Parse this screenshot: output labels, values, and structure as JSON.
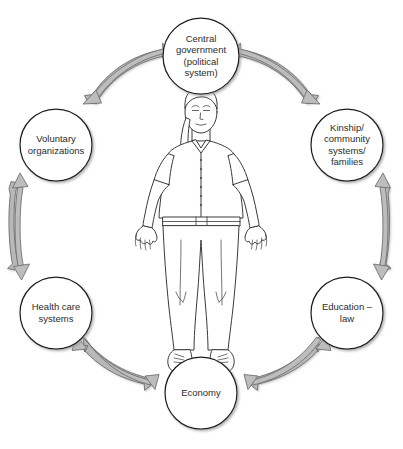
{
  "diagram": {
    "type": "circular-relationship-diagram",
    "background_color": "#ffffff",
    "node_fill": "#ffffff",
    "node_stroke": "#1c1c1c",
    "arrow_fill": "#b3b3b3",
    "arrow_stroke": "#6e6e6e",
    "text_color": "#2b2b2b",
    "center": {
      "name": "person-figure",
      "description": "Line drawing of a standing person with arms outstretched"
    },
    "nodes": [
      {
        "id": "central-government",
        "lines": [
          "Central",
          "government",
          "(political",
          "system)"
        ],
        "cx": 201,
        "cy": 56,
        "r": 38
      },
      {
        "id": "kinship-community-systems-families",
        "lines": [
          "Kinship/",
          "community",
          "systems/",
          "families"
        ],
        "cx": 347,
        "cy": 145,
        "r": 36
      },
      {
        "id": "education-law",
        "lines": [
          "Education –",
          "law"
        ],
        "cx": 347,
        "cy": 313,
        "r": 36
      },
      {
        "id": "economy",
        "lines": [
          "Economy"
        ],
        "cx": 201,
        "cy": 393,
        "r": 36
      },
      {
        "id": "health-care-systems",
        "lines": [
          "Health care",
          "systems"
        ],
        "cx": 56,
        "cy": 313,
        "r": 36
      },
      {
        "id": "voluntary-organizations",
        "lines": [
          "Voluntary",
          "organizations"
        ],
        "cx": 56,
        "cy": 145,
        "r": 36
      }
    ],
    "connections": [
      {
        "from": "voluntary-organizations",
        "to": "central-government",
        "bidirectional": true
      },
      {
        "from": "central-government",
        "to": "kinship-community-systems-families",
        "bidirectional": true
      },
      {
        "from": "kinship-community-systems-families",
        "to": "education-law",
        "bidirectional": true
      },
      {
        "from": "education-law",
        "to": "economy",
        "bidirectional": true
      },
      {
        "from": "economy",
        "to": "health-care-systems",
        "bidirectional": true
      },
      {
        "from": "health-care-systems",
        "to": "voluntary-organizations",
        "bidirectional": true
      }
    ]
  }
}
